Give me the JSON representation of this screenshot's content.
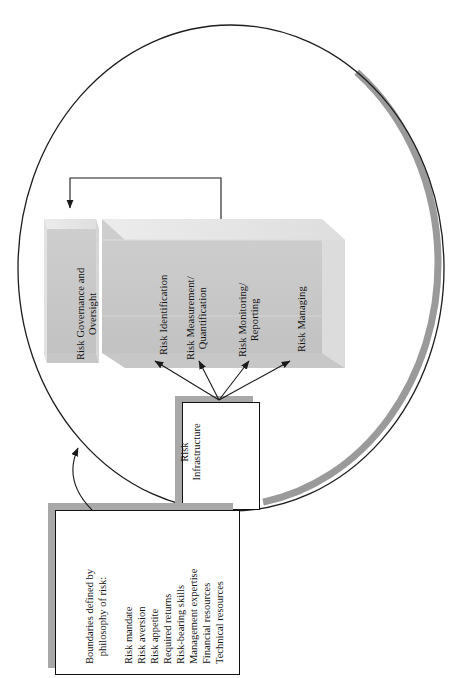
{
  "diagram": {
    "colors": {
      "ellipse_shadow": "#9a9a9a",
      "ellipse_stroke": "#1d1d1d",
      "block_front": "#c9c9c9",
      "block_top": "#e6e6e6",
      "block_side": "#d8d8d8",
      "box_fill": "#ffffff",
      "box_stroke": "#111111",
      "box_shadow": "#a8a8a8",
      "connector": "#1a1a1a",
      "text": "#141414"
    }
  },
  "ellipse": {
    "name": "risk-management-boundary-ellipse"
  },
  "blocks": [
    {
      "id": "governance",
      "label": "Risk Governance and\nOversight",
      "lines": [
        "Risk Governance and",
        "Oversight"
      ]
    }
  ],
  "pillar_block": {
    "id": "risk-process-block",
    "labels": [
      {
        "id": "identification",
        "lines": [
          "Risk Identification"
        ]
      },
      {
        "id": "measurement",
        "lines": [
          "Risk Measurement/",
          "Quantification"
        ]
      },
      {
        "id": "monitoring",
        "lines": [
          "Risk Monitoring/",
          "Reporting"
        ]
      },
      {
        "id": "managing",
        "lines": [
          "Risk Managing"
        ]
      }
    ]
  },
  "infrastructure_box": {
    "id": "risk-infrastructure",
    "lines": [
      "Risk",
      "Infrastructure"
    ]
  },
  "boundaries_box": {
    "id": "boundaries-of-risk-philosophy",
    "heading_lines": [
      "Boundaries defined by",
      "philosophy of risk:"
    ],
    "items": [
      "Risk mandate",
      "Risk aversion",
      "Risk appetite",
      "Required returns",
      "Risk-bearing skills",
      "Management expertise",
      "Financial resources",
      "Technical resources"
    ]
  },
  "connectors": [
    {
      "id": "bracket-to-governance",
      "type": "bracket-arrow",
      "from": "risk-process-block",
      "to": "governance"
    },
    {
      "id": "infra-to-identification",
      "type": "arrow",
      "from": "risk-infrastructure",
      "to": "identification"
    },
    {
      "id": "infra-to-measurement",
      "type": "arrow",
      "from": "risk-infrastructure",
      "to": "measurement"
    },
    {
      "id": "infra-to-monitoring",
      "type": "arrow",
      "from": "risk-infrastructure",
      "to": "monitoring"
    },
    {
      "id": "infra-to-managing",
      "type": "arrow",
      "from": "risk-infrastructure",
      "to": "managing"
    },
    {
      "id": "boundaries-to-framework",
      "type": "curved-arrow",
      "from": "boundaries-of-risk-philosophy",
      "to": "risk-management-boundary-ellipse"
    }
  ]
}
